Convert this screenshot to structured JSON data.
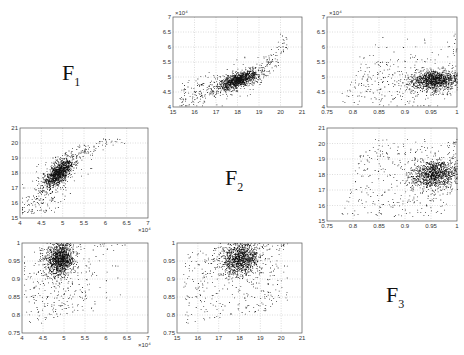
{
  "chart_data": {
    "type": "scatter",
    "title": "",
    "layout": "3x3 scatterplot matrix",
    "variables": [
      "F1",
      "F2",
      "F3"
    ],
    "diagonal_labels": [
      {
        "main": "F",
        "sub": "1"
      },
      {
        "main": "F",
        "sub": "2"
      },
      {
        "main": "F",
        "sub": "3"
      }
    ],
    "axes": {
      "F1": {
        "range": [
          40000,
          70000
        ],
        "ticks": [
          "4",
          "4.5",
          "5",
          "5.5",
          "6",
          "6.5",
          "7"
        ],
        "tick_values": [
          4,
          4.5,
          5,
          5.5,
          6,
          6.5,
          7
        ],
        "scale_label": "x 10^4",
        "scale_text": "×10⁴"
      },
      "F2": {
        "range": [
          15,
          21
        ],
        "ticks": [
          "15",
          "16",
          "17",
          "18",
          "19",
          "20",
          "21"
        ],
        "tick_values": [
          15,
          16,
          17,
          18,
          19,
          20,
          21
        ]
      },
      "F3": {
        "range": [
          0.75,
          1.0
        ],
        "ticks": [
          "0.75",
          "0.8",
          "0.85",
          "0.9",
          "0.95",
          "1"
        ],
        "tick_values": [
          0.75,
          0.8,
          0.85,
          0.9,
          0.95,
          1.0
        ]
      }
    },
    "panels": [
      {
        "id": "F2-vs-F1",
        "row": 0,
        "col": 1,
        "x_var": "F2",
        "y_var": "F1",
        "grid": true,
        "box": [
          173,
          17,
          302,
          107
        ],
        "description": "Positive, convex relationship; dense cluster near F2=17.5-19, F1=4.8-5.2e4; outliers up to F1=6.8e4 at F2~20.2"
      },
      {
        "id": "F3-vs-F1",
        "row": 0,
        "col": 2,
        "x_var": "F3",
        "y_var": "F1",
        "grid": true,
        "box": [
          327,
          17,
          457,
          107
        ],
        "description": "Positive linear trend; dense cluster at F3=0.92-0.99, F1=4.8-5.3e4"
      },
      {
        "id": "F1-vs-F2",
        "row": 1,
        "col": 0,
        "x_var": "F1",
        "y_var": "F2",
        "grid": true,
        "box": [
          20,
          128,
          148,
          218
        ],
        "description": "Positive concave relationship; dense cluster F1=4.8-5.3e4, F2=17-19; tail to F1=6.8e4, F2=20"
      },
      {
        "id": "F3-vs-F2",
        "row": 1,
        "col": 2,
        "x_var": "F3",
        "y_var": "F2",
        "grid": true,
        "box": [
          327,
          128,
          457,
          221
        ],
        "description": "Weak positive relationship; dense cluster F3=0.92-1.0, F2=17.3-19"
      },
      {
        "id": "F1-vs-F3",
        "row": 2,
        "col": 0,
        "x_var": "F1",
        "y_var": "F3",
        "grid": true,
        "box": [
          22,
          243,
          148,
          333
        ],
        "description": "Steep positive; dense cluster F1=4.7-5.3e4, F3=0.9-1.0; saturates at F3=1"
      },
      {
        "id": "F2-vs-F3",
        "row": 2,
        "col": 1,
        "x_var": "F2",
        "y_var": "F3",
        "grid": true,
        "box": [
          177,
          243,
          302,
          333
        ],
        "description": "Positive; dense cluster F2=17.3-19, F3=0.92-1.0; saturates at F3=1"
      }
    ],
    "point_model": {
      "n_points": 1400,
      "F2_mean": 18.0,
      "F2_sd": 0.6,
      "F1_base": 49000,
      "F1_slope_per_F2": 2200,
      "F3_center": 0.955
    },
    "xlabel": "",
    "ylabel": ""
  }
}
